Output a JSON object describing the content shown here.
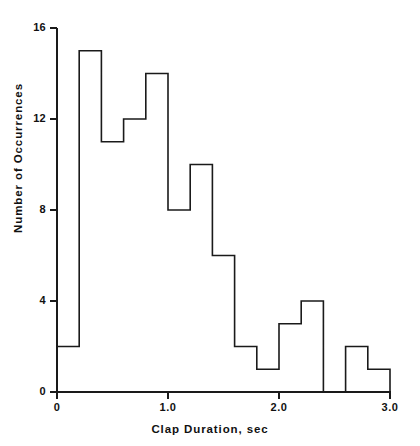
{
  "chart_data": {
    "type": "bar",
    "title": "",
    "subtitle": "",
    "xlabel": "Clap Duration, sec",
    "ylabel": "Number of Occurrences",
    "xlim": [
      0,
      3.0
    ],
    "ylim": [
      0,
      16
    ],
    "grid": false,
    "legend": null,
    "bin_width": 0.2,
    "bin_edges": [
      0,
      0.2,
      0.4,
      0.6,
      0.8,
      1.0,
      1.2,
      1.4,
      1.6,
      1.8,
      2.0,
      2.2,
      2.4,
      2.6,
      2.8,
      3.0
    ],
    "categories": [
      "0.0-0.2",
      "0.2-0.4",
      "0.4-0.6",
      "0.6-0.8",
      "0.8-1.0",
      "1.0-1.2",
      "1.2-1.4",
      "1.4-1.6",
      "1.6-1.8",
      "1.8-2.0",
      "2.0-2.2",
      "2.2-2.4",
      "2.4-2.6",
      "2.6-2.8",
      "2.8-3.0"
    ],
    "values": [
      2,
      15,
      11,
      12,
      14,
      8,
      10,
      6,
      2,
      1,
      3,
      4,
      0,
      2,
      1
    ],
    "xticks": [
      0,
      1.0,
      2.0,
      3.0
    ],
    "xtick_labels": [
      "0",
      "1.0",
      "2.0",
      "3.0"
    ],
    "yticks": [
      0,
      4,
      8,
      12,
      16
    ],
    "ytick_labels": [
      "0",
      "4",
      "8",
      "12",
      "16"
    ],
    "line_color": "#1a1a1a",
    "fill_color": "#ffffff",
    "background_color": "#ffffff"
  },
  "axes": {
    "y_ticks": [
      {
        "label": "16",
        "value": 16
      },
      {
        "label": "12",
        "value": 12
      },
      {
        "label": "8",
        "value": 8
      },
      {
        "label": "4",
        "value": 4
      },
      {
        "label": "0",
        "value": 0
      }
    ],
    "x_ticks": [
      {
        "label": "0",
        "value": 0
      },
      {
        "label": "1.0",
        "value": 1.0
      },
      {
        "label": "2.0",
        "value": 2.0
      },
      {
        "label": "3.0",
        "value": 3.0
      }
    ]
  }
}
